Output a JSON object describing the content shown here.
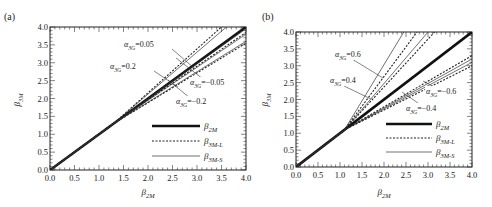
{
  "chart_data": [
    {
      "type": "line",
      "panel_label": "(a)",
      "xlabel": "β2M",
      "ylabel": "β3M",
      "xlim": [
        0,
        4.0
      ],
      "ylim": [
        0,
        4.0
      ],
      "xticks": [
        "0.0",
        "0.5",
        "1.0",
        "1.5",
        "2.0",
        "2.5",
        "3.0",
        "3.5",
        "4.0"
      ],
      "yticks": [
        "0.0",
        "0.5",
        "1.0",
        "1.5",
        "2.0",
        "2.5",
        "3.0",
        "3.5",
        "4.0"
      ],
      "grid": false,
      "legend": [
        {
          "label": "β2M",
          "style": "thick-solid"
        },
        {
          "label": "β3M-L",
          "style": "dashed"
        },
        {
          "label": "β3M-S",
          "style": "thin-solid"
        }
      ],
      "legend_position": "lower right",
      "annotations": [
        {
          "text": "α3G=0.05"
        },
        {
          "text": "α3G=0.2"
        },
        {
          "text": "α3G=−0.05"
        },
        {
          "text": "α3G=−0.2"
        }
      ],
      "series": [
        {
          "name": "β2M",
          "style": "thick-solid",
          "x": [
            0,
            4.0
          ],
          "y": [
            0,
            4.0
          ]
        },
        {
          "name": "β3M-L (α3G=0.2)",
          "style": "dashed",
          "x": [
            0,
            1.3,
            3.5
          ],
          "y": [
            0,
            1.3,
            4.0
          ]
        },
        {
          "name": "β3M-S (α3G=0.2)",
          "style": "thin-solid",
          "x": [
            0,
            1.3,
            3.6
          ],
          "y": [
            0,
            1.3,
            4.0
          ]
        },
        {
          "name": "β3M-L (α3G=0.05)",
          "style": "dashed",
          "x": [
            0,
            1.3,
            4.0
          ],
          "y": [
            0,
            1.3,
            4.0
          ]
        },
        {
          "name": "β3M-S (α3G=0.05)",
          "style": "thin-solid",
          "x": [
            0,
            1.3,
            4.0
          ],
          "y": [
            0,
            1.3,
            3.95
          ]
        },
        {
          "name": "β3M-L (α3G=-0.05)",
          "style": "dashed",
          "x": [
            0,
            1.3,
            4.0
          ],
          "y": [
            0,
            1.3,
            3.85
          ]
        },
        {
          "name": "β3M-S (α3G=-0.05)",
          "style": "thin-solid",
          "x": [
            0,
            1.3,
            4.0
          ],
          "y": [
            0,
            1.3,
            3.8
          ]
        },
        {
          "name": "β3M-L (α3G=-0.2)",
          "style": "dashed",
          "x": [
            0,
            1.3,
            4.0
          ],
          "y": [
            0,
            1.3,
            3.55
          ]
        },
        {
          "name": "β3M-S (α3G=-0.2)",
          "style": "thin-solid",
          "x": [
            0,
            1.3,
            4.0
          ],
          "y": [
            0,
            1.3,
            3.6
          ]
        }
      ]
    },
    {
      "type": "line",
      "panel_label": "(b)",
      "xlabel": "β2M",
      "ylabel": "β3M",
      "xlim": [
        0,
        4.0
      ],
      "ylim": [
        0,
        4.0
      ],
      "xticks": [
        "0.0",
        "0.5",
        "1.0",
        "1.5",
        "2.0",
        "2.5",
        "3.0",
        "3.5",
        "4.0"
      ],
      "yticks": [
        "0.0",
        "0.5",
        "1.0",
        "1.5",
        "2.0",
        "2.5",
        "3.0",
        "3.5",
        "4.0"
      ],
      "grid": false,
      "legend": [
        {
          "label": "β2M",
          "style": "thick-solid"
        },
        {
          "label": "β3M-L",
          "style": "dashed"
        },
        {
          "label": "β3M-S",
          "style": "thin-solid"
        }
      ],
      "legend_position": "lower right",
      "annotations": [
        {
          "text": "α3G=0.6"
        },
        {
          "text": "α3G=0.4"
        },
        {
          "text": "α3G=−0.6"
        },
        {
          "text": "α3G=−0.4"
        }
      ],
      "series": [
        {
          "name": "β2M",
          "style": "thick-solid",
          "x": [
            0,
            4.0
          ],
          "y": [
            0,
            4.0
          ]
        },
        {
          "name": "β3M-S (α3G=0.6)",
          "style": "thin-solid",
          "x": [
            0,
            1.1,
            2.45
          ],
          "y": [
            0,
            1.1,
            4.0
          ]
        },
        {
          "name": "β3M-L (α3G=0.6)",
          "style": "dashed",
          "x": [
            0,
            1.1,
            2.75
          ],
          "y": [
            0,
            1.1,
            4.0
          ]
        },
        {
          "name": "β3M-S (α3G=0.4)",
          "style": "thin-solid",
          "x": [
            0,
            1.1,
            3.0
          ],
          "y": [
            0,
            1.1,
            4.0
          ]
        },
        {
          "name": "β3M-L (α3G=0.4)",
          "style": "dashed",
          "x": [
            0,
            1.1,
            3.15
          ],
          "y": [
            0,
            1.1,
            4.0
          ]
        },
        {
          "name": "β3M-L (α3G=-0.4)",
          "style": "dashed",
          "x": [
            0,
            1.1,
            4.0
          ],
          "y": [
            0,
            1.1,
            3.3
          ]
        },
        {
          "name": "β3M-S (α3G=-0.4)",
          "style": "thin-solid",
          "x": [
            0,
            1.1,
            4.0
          ],
          "y": [
            0,
            1.1,
            3.2
          ]
        },
        {
          "name": "β3M-S (α3G=-0.6)",
          "style": "thin-solid",
          "x": [
            0,
            1.1,
            4.0
          ],
          "y": [
            0,
            1.1,
            3.1
          ]
        },
        {
          "name": "β3M-L (α3G=-0.6)",
          "style": "dashed",
          "x": [
            0,
            1.1,
            4.0
          ],
          "y": [
            0,
            1.1,
            3.0
          ]
        }
      ]
    }
  ],
  "layout": {
    "panels": [
      {
        "left": 50,
        "top": 27,
        "right": 246,
        "bottom": 170,
        "panel_label_pos": [
          4,
          20
        ],
        "ylabel_pos": [
          20,
          100
        ],
        "xlabel_pos": [
          148,
          195
        ],
        "legend": {
          "x1": 152,
          "x2": 200,
          "label_x": 204,
          "ys": [
            126,
            141,
            156
          ]
        },
        "annotations": [
          {
            "tx": 124,
            "ty": 47,
            "lx1": 172,
            "ly1": 49,
            "lx2": 194,
            "ly2": 68
          },
          {
            "tx": 110,
            "ty": 69,
            "lx1": 154,
            "ly1": 71,
            "lx2": 178,
            "ly2": 87
          },
          {
            "tx": 190,
            "ty": 85,
            "lx1": 203,
            "ly1": 79,
            "lx2": 176,
            "ly2": 58
          },
          {
            "tx": 176,
            "ty": 104,
            "lx1": 190,
            "ly1": 98,
            "lx2": 168,
            "ly2": 80
          }
        ]
      },
      {
        "left": 296,
        "top": 32,
        "right": 472,
        "bottom": 167,
        "panel_label_pos": [
          262,
          20
        ],
        "ylabel_pos": [
          268,
          100
        ],
        "xlabel_pos": [
          384,
          195
        ],
        "legend": {
          "x1": 386,
          "x2": 432,
          "label_x": 436,
          "ys": [
            124,
            138,
            152
          ]
        },
        "annotations": [
          {
            "tx": 335,
            "ty": 57,
            "lx1": 352,
            "ly1": 59,
            "lx2": 383,
            "ly2": 78
          },
          {
            "tx": 330,
            "ty": 83,
            "lx1": 344,
            "ly1": 86,
            "lx2": 371,
            "ly2": 99
          },
          {
            "tx": 426,
            "ty": 94,
            "lx1": 438,
            "ly1": 89,
            "lx2": 423,
            "ly2": 81
          },
          {
            "tx": 406,
            "ty": 111,
            "lx1": 418,
            "ly1": 103,
            "lx2": 402,
            "ly2": 92
          }
        ]
      }
    ]
  }
}
